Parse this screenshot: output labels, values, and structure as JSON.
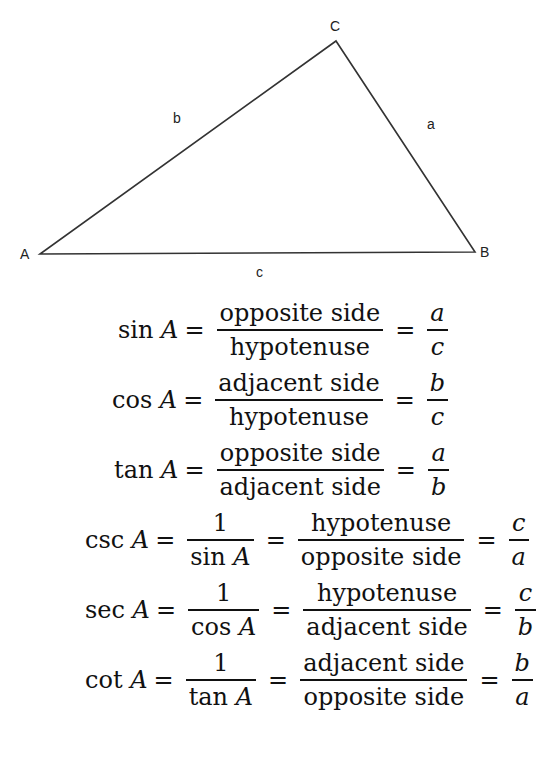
{
  "header_fragment": "... is called the hypotenuse",
  "diagram": {
    "vertices": [
      {
        "label": "A",
        "x": 40,
        "y": 254
      },
      {
        "label": "B",
        "x": 475,
        "y": 252
      },
      {
        "label": "C",
        "x": 336,
        "y": 41
      }
    ],
    "side_labels": {
      "a": "a",
      "b": "b",
      "c": "c"
    }
  },
  "equations": [
    {
      "fn": "sin A",
      "terms": [
        {
          "num": "opposite side",
          "den": "hypotenuse"
        },
        {
          "num": "a",
          "den": "c",
          "italic": true
        }
      ]
    },
    {
      "fn": "cos A",
      "terms": [
        {
          "num": "adjacent side",
          "den": "hypotenuse"
        },
        {
          "num": "b",
          "den": "c",
          "italic": true
        }
      ]
    },
    {
      "fn": "tan A",
      "terms": [
        {
          "num": "opposite side",
          "den": "adjacent side"
        },
        {
          "num": "a",
          "den": "b",
          "italic": true
        }
      ]
    },
    {
      "fn": "csc A",
      "terms": [
        {
          "num": "1",
          "den": "sin A"
        },
        {
          "num": "hypotenuse",
          "den": "opposite side"
        },
        {
          "num": "c",
          "den": "a",
          "italic": true
        }
      ]
    },
    {
      "fn": "sec A",
      "terms": [
        {
          "num": "1",
          "den": "cos A"
        },
        {
          "num": "hypotenuse",
          "den": "adjacent side"
        },
        {
          "num": "c",
          "den": "b",
          "italic": true
        }
      ]
    },
    {
      "fn": "cot A",
      "terms": [
        {
          "num": "1",
          "den": "tan A"
        },
        {
          "num": "adjacent side",
          "den": "opposite side"
        },
        {
          "num": "b",
          "den": "a",
          "italic": true
        }
      ]
    }
  ]
}
